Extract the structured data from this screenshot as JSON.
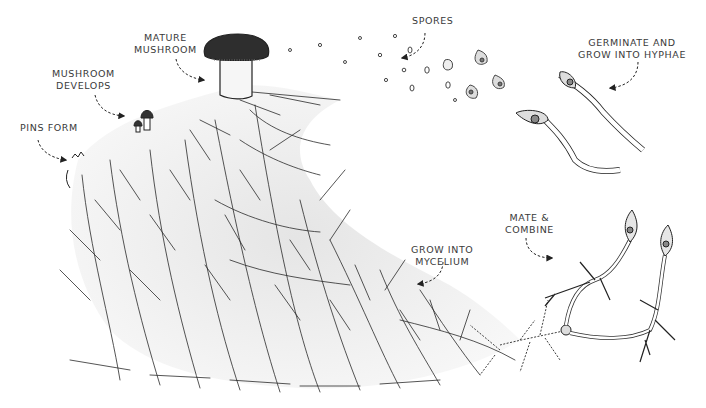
{
  "labels": {
    "pins_form": {
      "lines": [
        "PINS FORM"
      ]
    },
    "mushroom_develops": {
      "lines": [
        "MUSHROOM",
        "DEVELOPS"
      ]
    },
    "mature_mushroom": {
      "lines": [
        "MATURE",
        "MUSHROOM"
      ]
    },
    "spores": {
      "lines": [
        "SPORES"
      ]
    },
    "germinate": {
      "lines": [
        "GERMINATE AND",
        "GROW INTO HYPHAE"
      ]
    },
    "mate_combine": {
      "lines": [
        "MATE &",
        "COMBINE"
      ]
    },
    "grow_mycelium": {
      "lines": [
        "GROW INTO",
        "MYCELIUM"
      ]
    }
  },
  "stages": [
    "Spores",
    "Germinate and grow into hyphae",
    "Mate & combine",
    "Grow into mycelium",
    "Pins form",
    "Mushroom develops",
    "Mature mushroom"
  ],
  "colors": {
    "ink": "#222222",
    "shade": "#d9d9d9",
    "cap": "#2e2e2e",
    "label": "#3a3a3a"
  }
}
